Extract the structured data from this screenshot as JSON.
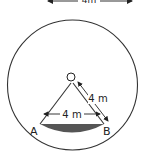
{
  "diagram": {
    "title_cropped": "4m",
    "center_label": "O",
    "point_a_label": "A",
    "point_b_label": "B",
    "chord_length_label": "4 m",
    "radius_length_label": "4 m",
    "colors": {
      "stroke": "#333333",
      "segment_fill": "#555555",
      "background": "#ffffff"
    }
  }
}
